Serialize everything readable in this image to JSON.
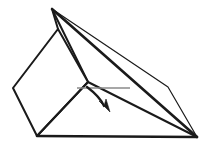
{
  "figure": {
    "background_color": "#ffffff",
    "stroke_color": "#1a1a1a",
    "hinge_color": "#8a8a8a",
    "canvas": {
      "width": 212,
      "height": 148
    }
  },
  "geometry": {
    "points": {
      "apex": {
        "x": 52,
        "y": 9,
        "label": "apex"
      },
      "flap_top": {
        "x": 58,
        "y": 29,
        "label": "flap-top-corner"
      },
      "flap_left": {
        "x": 13,
        "y": 88,
        "label": "flap-left-corner"
      },
      "flap_bottom": {
        "x": 37,
        "y": 136,
        "label": "flap-bottom-corner"
      },
      "flap_right": {
        "x": 88,
        "y": 82,
        "label": "flap-right-corner"
      },
      "ridge_bend": {
        "x": 168,
        "y": 87,
        "label": "ridge-bend"
      },
      "base_right": {
        "x": 197,
        "y": 137,
        "label": "base-right-corner"
      },
      "base_left": {
        "x": 37,
        "y": 136,
        "label": "base-left-corner"
      },
      "hinge_start": {
        "x": 77,
        "y": 88,
        "label": "hinge-left-end"
      },
      "hinge_end": {
        "x": 130,
        "y": 88,
        "label": "hinge-right-end"
      }
    },
    "edges": [
      {
        "name": "base-edge",
        "from": "base_left",
        "to": "base_right",
        "weight": "heavy"
      },
      {
        "name": "apex-to-base-right-front",
        "from": "apex",
        "to": "base_right",
        "weight": "heavy"
      },
      {
        "name": "apex-to-flap-top",
        "from": "apex",
        "to": "flap_top",
        "weight": "medium"
      },
      {
        "name": "apex-to-ridge-bend",
        "from": "apex",
        "to": "ridge_bend",
        "weight": "light"
      },
      {
        "name": "ridge-bend-to-base-right",
        "from": "ridge_bend",
        "to": "base_right",
        "weight": "light"
      },
      {
        "name": "flap-top-to-flap-left",
        "from": "flap_top",
        "to": "flap_left",
        "weight": "medium"
      },
      {
        "name": "flap-left-to-flap-bottom",
        "from": "flap_left",
        "to": "flap_bottom",
        "weight": "medium"
      },
      {
        "name": "flap-bottom-to-flap-right",
        "from": "flap_bottom",
        "to": "flap_right",
        "weight": "medium"
      },
      {
        "name": "flap-right-to-flap-top",
        "from": "flap_right",
        "to": "flap_top",
        "weight": "medium"
      },
      {
        "name": "flap-right-to-apex-crease",
        "from": "flap_right",
        "to": "apex",
        "weight": "medium"
      }
    ],
    "hinge": {
      "name": "fold-hinge-line",
      "x1": 77,
      "y1": 88,
      "x2": 130,
      "y2": 88
    },
    "arrow": {
      "name": "fold-direction-arrow",
      "path": "M 87 87 C 95 93 101 99 104 106",
      "head": "M 99 101 L 110 112 L 106 99 L 104 106 Z",
      "direction": "down-right",
      "meaning": "fold direction"
    }
  },
  "labels": {
    "items": []
  }
}
